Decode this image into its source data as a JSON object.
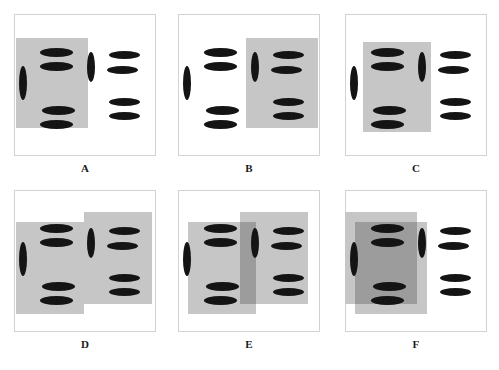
{
  "figure": {
    "type": "perceptual-grouping-panels",
    "panel_count": 6,
    "background_color": "#ffffff",
    "frame_color": "#d2d2d2",
    "ellipse_color": "#141414",
    "rect_color": "#c6c6c6",
    "rect_overlap_color": "#9c9c9c"
  },
  "geometry": {
    "panel_w": 142,
    "panel_h": 142,
    "row_tops": [
      14,
      190
    ],
    "col_lefts": [
      14,
      178,
      345
    ],
    "caption_offset": 20
  },
  "element_template": {
    "note": "Each panel shows the same 10 ellipses: a left cluster and a right cluster. Each cluster is one vertical ellipse plus four horizontal ellipses arranged as two pairs.",
    "ellipses": [
      {
        "name": "left-vertical-ellipse",
        "x": 5,
        "y": 52,
        "w": 8,
        "h": 34,
        "orient": "vertical"
      },
      {
        "name": "left-horizontal-1",
        "x": 26,
        "y": 34,
        "w": 33,
        "h": 9,
        "orient": "horizontal"
      },
      {
        "name": "left-horizontal-2",
        "x": 26,
        "y": 48,
        "w": 33,
        "h": 9,
        "orient": "horizontal"
      },
      {
        "name": "left-horizontal-3",
        "x": 28,
        "y": 92,
        "w": 33,
        "h": 9,
        "orient": "horizontal"
      },
      {
        "name": "left-horizontal-4",
        "x": 26,
        "y": 106,
        "w": 33,
        "h": 9,
        "orient": "horizontal"
      },
      {
        "name": "right-vertical-ellipse",
        "x": 73,
        "y": 38,
        "w": 8,
        "h": 30,
        "orient": "vertical"
      },
      {
        "name": "right-horizontal-1",
        "x": 95,
        "y": 37,
        "w": 31,
        "h": 8,
        "orient": "horizontal"
      },
      {
        "name": "right-horizontal-2",
        "x": 93,
        "y": 52,
        "w": 31,
        "h": 8,
        "orient": "horizontal"
      },
      {
        "name": "right-horizontal-3",
        "x": 95,
        "y": 84,
        "w": 31,
        "h": 8,
        "orient": "horizontal"
      },
      {
        "name": "right-horizontal-4",
        "x": 95,
        "y": 98,
        "w": 31,
        "h": 8,
        "orient": "horizontal"
      }
    ]
  },
  "panels": [
    {
      "id": "A",
      "label": "A",
      "row": 0,
      "col": 0,
      "description": "Single gray rectangle covering the left ellipse cluster only.",
      "rects": [
        {
          "name": "gray-rect-left",
          "x": 2,
          "y": 24,
          "w": 72,
          "h": 90,
          "shade": "light"
        }
      ]
    },
    {
      "id": "B",
      "label": "B",
      "row": 0,
      "col": 1,
      "description": "Single gray rectangle covering the right ellipse cluster only.",
      "rects": [
        {
          "name": "gray-rect-right",
          "x": 68,
          "y": 24,
          "w": 72,
          "h": 90,
          "shade": "light"
        }
      ]
    },
    {
      "id": "C",
      "label": "C",
      "row": 0,
      "col": 2,
      "description": "Single gray rectangle covering the left cluster horizontals and the right cluster's vertical ellipse.",
      "rects": [
        {
          "name": "gray-rect-center-left",
          "x": 18,
          "y": 28,
          "w": 68,
          "h": 90,
          "shade": "light"
        }
      ]
    },
    {
      "id": "D",
      "label": "D",
      "row": 1,
      "col": 0,
      "description": "Two abutting gray rectangles, the right one raised; no overlap.",
      "rects": [
        {
          "name": "gray-rect-left",
          "x": 2,
          "y": 32,
          "w": 68,
          "h": 92,
          "shade": "light"
        },
        {
          "name": "gray-rect-right",
          "x": 70,
          "y": 22,
          "w": 68,
          "h": 92,
          "shade": "light"
        }
      ]
    },
    {
      "id": "E",
      "label": "E",
      "row": 1,
      "col": 1,
      "description": "Two gray rectangles overlapping in the middle; the overlap band is darker.",
      "rects": [
        {
          "name": "gray-rect-left",
          "x": 10,
          "y": 32,
          "w": 68,
          "h": 92,
          "shade": "light"
        },
        {
          "name": "gray-rect-right",
          "x": 62,
          "y": 22,
          "w": 68,
          "h": 92,
          "shade": "light"
        },
        {
          "name": "gray-rect-overlap",
          "x": 62,
          "y": 32,
          "w": 16,
          "h": 82,
          "shade": "dark"
        }
      ]
    },
    {
      "id": "F",
      "label": "F",
      "row": 1,
      "col": 2,
      "description": "Two gray rectangles almost fully overlapping over the left cluster; the large overlap is darker.",
      "rects": [
        {
          "name": "gray-rect-back",
          "x": 0,
          "y": 22,
          "w": 72,
          "h": 92,
          "shade": "light"
        },
        {
          "name": "gray-rect-front",
          "x": 10,
          "y": 32,
          "w": 72,
          "h": 92,
          "shade": "light"
        },
        {
          "name": "gray-rect-overlap",
          "x": 10,
          "y": 32,
          "w": 62,
          "h": 82,
          "shade": "dark"
        }
      ]
    }
  ]
}
